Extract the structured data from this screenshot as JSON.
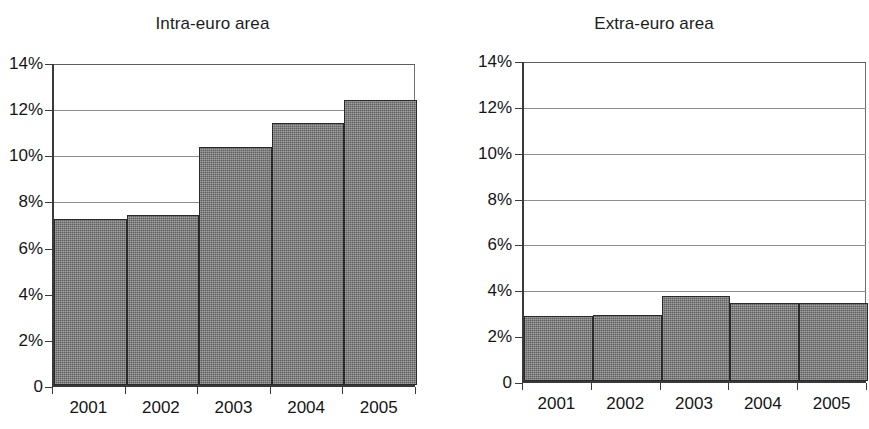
{
  "figure": {
    "background_color": "#ffffff",
    "bar_fill_color": "#797979",
    "bar_edge_color": "#2a2a2a",
    "gridline_color": "#8e8e8e",
    "axis_color": "#3a3a3a"
  },
  "chart_data": [
    {
      "type": "bar",
      "title": "Intra-euro area",
      "categories": [
        "2001",
        "2002",
        "2003",
        "2004",
        "2005"
      ],
      "values": [
        7.2,
        7.35,
        10.3,
        11.35,
        12.35
      ],
      "xlabel": "",
      "ylabel": "",
      "ylim": [
        0,
        14
      ],
      "yticks": [
        0,
        2,
        4,
        6,
        8,
        10,
        12,
        14
      ],
      "ytick_labels": [
        "0",
        "2%",
        "4%",
        "6%",
        "8%",
        "10%",
        "12%",
        "14%"
      ],
      "grid": true,
      "legend": null
    },
    {
      "type": "bar",
      "title": "Extra-euro area",
      "categories": [
        "2001",
        "2002",
        "2003",
        "2004",
        "2005"
      ],
      "values": [
        2.85,
        2.9,
        3.7,
        3.4,
        3.4
      ],
      "xlabel": "",
      "ylabel": "",
      "ylim": [
        0,
        14
      ],
      "yticks": [
        0,
        2,
        4,
        6,
        8,
        10,
        12,
        14
      ],
      "ytick_labels": [
        "0",
        "2%",
        "4%",
        "6%",
        "8%",
        "10%",
        "12%",
        "14%"
      ],
      "grid": true,
      "legend": null
    }
  ]
}
